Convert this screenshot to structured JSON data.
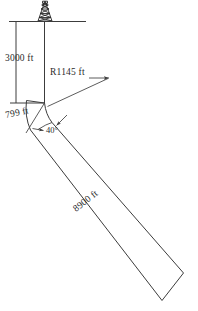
{
  "diagram": {
    "labels": {
      "vertical_depth": "3000 ft",
      "radius": "R1145 ft",
      "build_arc": "799 ft",
      "inclination_angle": "40°",
      "tangent_length": "8900 ft"
    },
    "icons": {
      "derrick": "drilling-rig-icon",
      "ground": "ground-line-icon",
      "arrow_radius": "radius-leader-arrow-icon",
      "arrow_angle": "angle-leader-arrow-icon",
      "arrow_tangent": "tangent-leader-arrow-icon"
    },
    "colors": {
      "line": "#3c3c3c",
      "text": "#2b2b2b",
      "background": "#ffffff"
    },
    "geometry": {
      "kickoff_depth_label": "3000 ft",
      "build_section_label": "799 ft",
      "hold_angle_label": "40°",
      "hold_length_label": "8900 ft",
      "build_radius_label": "R1145 ft"
    }
  }
}
